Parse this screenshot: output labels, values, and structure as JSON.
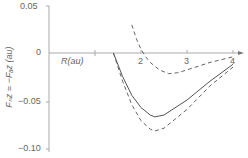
{
  "chart_data": {
    "type": "line",
    "title": "",
    "xlabel": "R(au)",
    "ylabel": "F_bz = −F_az (au)",
    "xlim": [
      0,
      4.2
    ],
    "ylim": [
      -0.1,
      0.05
    ],
    "x_ticks": [
      "1",
      "2",
      "3",
      "4"
    ],
    "y_ticks": [
      "0.05",
      "0",
      "−0.05",
      "−0.10"
    ],
    "grid": false,
    "legend": null,
    "series": [
      {
        "name": "solid curve",
        "style": "solid",
        "x": [
          1.4,
          1.6,
          1.8,
          2.0,
          2.2,
          2.3,
          2.5,
          3.0,
          3.5,
          4.0
        ],
        "y": [
          0.0,
          -0.025,
          -0.045,
          -0.058,
          -0.066,
          -0.068,
          -0.066,
          -0.05,
          -0.03,
          -0.012
        ]
      },
      {
        "name": "lower dashed curve",
        "style": "dashed",
        "x": [
          1.4,
          1.6,
          1.8,
          2.0,
          2.2,
          2.3,
          2.5,
          3.0,
          3.5,
          4.0
        ],
        "y": [
          0.0,
          -0.03,
          -0.055,
          -0.072,
          -0.081,
          -0.083,
          -0.08,
          -0.06,
          -0.035,
          -0.015
        ]
      },
      {
        "name": "upper dashed curve",
        "style": "dashed",
        "x": [
          1.8,
          1.9,
          2.0,
          2.1,
          2.2,
          2.4,
          2.6,
          2.8,
          3.0,
          3.5,
          4.0
        ],
        "y": [
          0.03,
          0.015,
          0.004,
          -0.004,
          -0.01,
          -0.018,
          -0.022,
          -0.021,
          -0.018,
          -0.01,
          -0.004
        ]
      }
    ]
  },
  "labels": {
    "xlabel": "R(au)",
    "ylabel": "Fₙz = −Fₐz (au)",
    "x_ticks": [
      "1",
      "2",
      "3",
      "4"
    ],
    "y_ticks": [
      "0.05",
      "0",
      "−0.05",
      "−0.10"
    ]
  }
}
